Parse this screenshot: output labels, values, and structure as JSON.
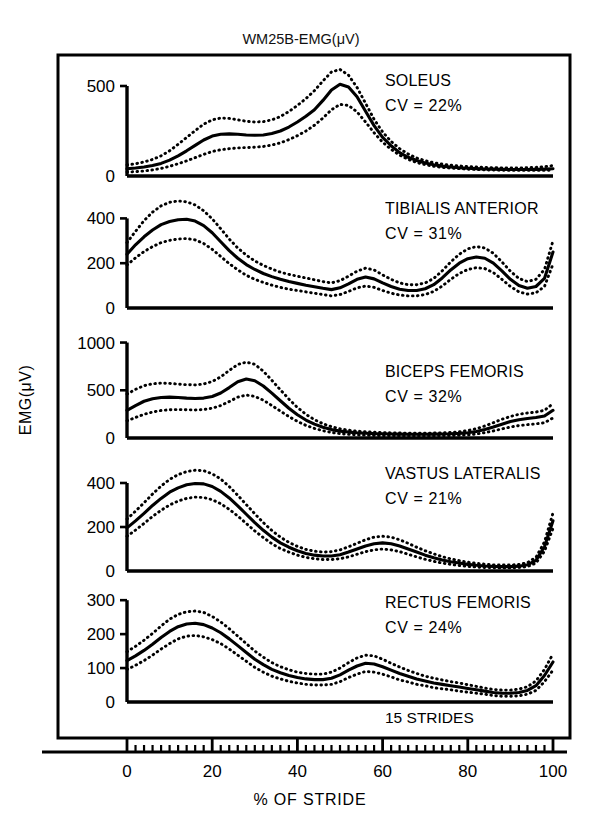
{
  "figure": {
    "title": "WM25B-EMG(μV)",
    "ylabel": "EMG(μV)",
    "xlabel": "% OF STRIDE",
    "strides_note": "15 STRIDES",
    "frame_color": "#000000",
    "curve_color": "#000000",
    "background": "#ffffff"
  },
  "chart_data": {
    "type": "line",
    "title": "WM25B-EMG(μV)",
    "xlabel": "% OF STRIDE",
    "ylabel": "EMG(μV)",
    "grid": false,
    "legend_position": "none",
    "annotations": [
      "15 STRIDES"
    ],
    "xlim": [
      0,
      100
    ],
    "xticks": [
      0,
      20,
      40,
      60,
      80,
      100
    ],
    "xticklabels": [
      "0",
      "20",
      "40",
      "60",
      "80",
      "100"
    ],
    "x_minor_tick_step": 2,
    "x": [
      0,
      2,
      4,
      6,
      8,
      10,
      12,
      14,
      16,
      18,
      20,
      22,
      24,
      26,
      28,
      30,
      32,
      34,
      36,
      38,
      40,
      42,
      44,
      46,
      48,
      50,
      52,
      54,
      56,
      58,
      60,
      62,
      64,
      66,
      68,
      70,
      72,
      74,
      76,
      78,
      80,
      82,
      84,
      86,
      88,
      90,
      92,
      94,
      96,
      98,
      100
    ],
    "panels": [
      {
        "muscle": "SOLEUS",
        "cv_label": "CV = 22%",
        "cv_percent": 22,
        "ylim": [
          0,
          600
        ],
        "yticks": [
          0,
          500
        ],
        "yticklabels": [
          "0",
          "500"
        ],
        "series": [
          {
            "name": "mean",
            "style": "solid",
            "values": [
              40,
              44,
              50,
              58,
              70,
              88,
              112,
              140,
              170,
              200,
              222,
              232,
              234,
              232,
              228,
              226,
              228,
              236,
              250,
              272,
              300,
              332,
              368,
              420,
              478,
              510,
              495,
              440,
              360,
              280,
              215,
              168,
              130,
              104,
              86,
              72,
              62,
              55,
              50,
              46,
              43,
              41,
              39,
              38,
              37,
              36,
              36,
              36,
              37,
              38,
              40
            ]
          },
          {
            "name": "+1SD",
            "style": "dotted",
            "values": [
              62,
              68,
              78,
              92,
              112,
              140,
              176,
              214,
              252,
              288,
              312,
              322,
              320,
              312,
              304,
              300,
              302,
              312,
              330,
              358,
              392,
              430,
              474,
              528,
              578,
              592,
              560,
              492,
              404,
              315,
              245,
              192,
              152,
              122,
              100,
              85,
              74,
              66,
              60,
              56,
              52,
              50,
              48,
              46,
              45,
              45,
              45,
              46,
              48,
              52,
              58
            ]
          },
          {
            "name": "-1SD",
            "style": "dotted",
            "values": [
              22,
              24,
              28,
              34,
              42,
              54,
              68,
              84,
              102,
              120,
              136,
              146,
              152,
              156,
              158,
              160,
              164,
              172,
              184,
              202,
              224,
              250,
              282,
              322,
              368,
              398,
              392,
              356,
              300,
              240,
              188,
              148,
              116,
              92,
              75,
              63,
              54,
              48,
              44,
              41,
              38,
              36,
              34,
              33,
              32,
              31,
              31,
              31,
              31,
              31,
              32
            ]
          }
        ]
      },
      {
        "muscle": "TIBIALIS ANTERIOR",
        "cv_label": "CV = 31%",
        "cv_percent": 31,
        "ylim": [
          0,
          500
        ],
        "yticks": [
          0,
          200,
          400
        ],
        "yticklabels": [
          "0",
          "200",
          "400"
        ],
        "series": [
          {
            "name": "mean",
            "style": "solid",
            "values": [
              240,
              282,
              318,
              348,
              372,
              386,
              394,
              396,
              388,
              368,
              336,
              296,
              256,
              222,
              194,
              172,
              154,
              140,
              128,
              118,
              110,
              102,
              95,
              88,
              82,
              90,
              108,
              128,
              138,
              130,
              112,
              96,
              84,
              78,
              78,
              86,
              104,
              134,
              170,
              200,
              220,
              228,
              222,
              200,
              166,
              128,
              100,
              88,
              96,
              132,
              250
            ]
          },
          {
            "name": "+1SD",
            "style": "dotted",
            "values": [
              292,
              342,
              390,
              428,
              456,
              472,
              478,
              474,
              460,
              434,
              398,
              354,
              308,
              268,
              236,
              210,
              190,
              174,
              160,
              150,
              142,
              134,
              126,
              118,
              112,
              122,
              142,
              164,
              178,
              170,
              148,
              128,
              112,
              104,
              104,
              112,
              132,
              166,
              206,
              240,
              264,
              274,
              268,
              244,
              206,
              164,
              132,
              118,
              128,
              172,
              300
            ]
          },
          {
            "name": "-1SD",
            "style": "dotted",
            "values": [
              192,
              224,
              252,
              274,
              292,
              302,
              308,
              310,
              304,
              288,
              262,
              230,
              198,
              170,
              146,
              128,
              114,
              102,
              92,
              84,
              78,
              72,
              66,
              60,
              54,
              60,
              74,
              90,
              98,
              92,
              78,
              66,
              58,
              54,
              54,
              60,
              74,
              98,
              128,
              154,
              172,
              180,
              176,
              158,
              128,
              96,
              72,
              62,
              68,
              96,
              196
            ]
          }
        ]
      },
      {
        "muscle": "BICEPS FEMORIS",
        "cv_label": "CV = 32%",
        "cv_percent": 32,
        "ylim": [
          0,
          1100
        ],
        "yticks": [
          0,
          500,
          1000
        ],
        "yticklabels": [
          "0",
          "500",
          "1000"
        ],
        "series": [
          {
            "name": "mean",
            "style": "solid",
            "values": [
              290,
              340,
              385,
              412,
              425,
              428,
              424,
              418,
              414,
              418,
              435,
              472,
              528,
              590,
              618,
              600,
              545,
              470,
              390,
              312,
              244,
              188,
              145,
              112,
              88,
              72,
              62,
              55,
              50,
              46,
              44,
              42,
              41,
              40,
              40,
              40,
              41,
              42,
              44,
              48,
              55,
              68,
              88,
              115,
              145,
              172,
              192,
              205,
              215,
              230,
              290
            ]
          },
          {
            "name": "+1SD",
            "style": "dotted",
            "values": [
              460,
              510,
              548,
              568,
              575,
              572,
              565,
              558,
              556,
              566,
              592,
              640,
              708,
              770,
              795,
              772,
              700,
              605,
              505,
              408,
              320,
              248,
              192,
              150,
              118,
              96,
              82,
              72,
              65,
              60,
              56,
              54,
              52,
              51,
              51,
              51,
              52,
              54,
              58,
              65,
              78,
              98,
              126,
              160,
              196,
              226,
              248,
              262,
              272,
              290,
              360
            ]
          },
          {
            "name": "-1SD",
            "style": "dotted",
            "values": [
              180,
              215,
              248,
              272,
              288,
              296,
              298,
              296,
              294,
              298,
              312,
              340,
              382,
              428,
              450,
              436,
              396,
              340,
              282,
              224,
              174,
              132,
              100,
              76,
              58,
              46,
              38,
              33,
              29,
              26,
              24,
              23,
              22,
              21,
              21,
              21,
              22,
              23,
              25,
              28,
              33,
              42,
              56,
              74,
              95,
              115,
              130,
              140,
              148,
              160,
              210
            ]
          }
        ]
      },
      {
        "muscle": "VASTUS LATERALIS",
        "cv_label": "CV = 21%",
        "cv_percent": 21,
        "ylim": [
          0,
          500
        ],
        "yticks": [
          0,
          200,
          400
        ],
        "yticklabels": [
          "0",
          "200",
          "400"
        ],
        "series": [
          {
            "name": "mean",
            "style": "solid",
            "values": [
              196,
              228,
              262,
              298,
              330,
              358,
              378,
              392,
              398,
              396,
              384,
              362,
              332,
              296,
              258,
              220,
              185,
              154,
              128,
              108,
              92,
              80,
              72,
              68,
              68,
              74,
              86,
              100,
              114,
              124,
              128,
              124,
              114,
              100,
              86,
              72,
              60,
              50,
              42,
              36,
              30,
              26,
              23,
              21,
              20,
              20,
              22,
              28,
              48,
              110,
              228
            ]
          },
          {
            "name": "+1SD",
            "style": "dotted",
            "values": [
              236,
              272,
              310,
              350,
              386,
              416,
              438,
              452,
              458,
              456,
              442,
              418,
              384,
              344,
              302,
              260,
              220,
              184,
              154,
              130,
              112,
              98,
              90,
              86,
              88,
              96,
              110,
              126,
              142,
              154,
              158,
              154,
              142,
              126,
              108,
              92,
              78,
              65,
              55,
              47,
              40,
              35,
              31,
              28,
              27,
              27,
              30,
              38,
              62,
              132,
              264
            ]
          },
          {
            "name": "-1SD",
            "style": "dotted",
            "values": [
              158,
              186,
              216,
              248,
              276,
              300,
              318,
              330,
              336,
              334,
              324,
              306,
              280,
              250,
              216,
              182,
              152,
              124,
              102,
              86,
              72,
              62,
              56,
              52,
              52,
              56,
              64,
              76,
              88,
              96,
              100,
              96,
              88,
              76,
              64,
              53,
              44,
              36,
              30,
              25,
              21,
              18,
              16,
              15,
              14,
              14,
              16,
              20,
              36,
              90,
              194
            ]
          }
        ]
      },
      {
        "muscle": "RECTUS FEMORIS",
        "cv_label": "CV = 24%",
        "cv_percent": 24,
        "ylim": [
          0,
          330
        ],
        "yticks": [
          0,
          100,
          200,
          300
        ],
        "yticklabels": [
          "0",
          "100",
          "200",
          "300"
        ],
        "series": [
          {
            "name": "mean",
            "style": "solid",
            "values": [
              122,
              136,
              152,
              170,
              190,
              208,
              222,
              230,
              232,
              228,
              218,
              204,
              186,
              166,
              146,
              126,
              110,
              96,
              86,
              78,
              72,
              68,
              66,
              66,
              70,
              80,
              94,
              106,
              114,
              112,
              104,
              94,
              84,
              76,
              68,
              62,
              56,
              52,
              48,
              44,
              40,
              36,
              32,
              28,
              26,
              26,
              28,
              34,
              48,
              78,
              118
            ]
          },
          {
            "name": "+1SD",
            "style": "dotted",
            "values": [
              148,
              164,
              182,
              202,
              224,
              244,
              258,
              266,
              268,
              264,
              252,
              236,
              216,
              194,
              172,
              150,
              132,
              116,
              104,
              95,
              88,
              84,
              82,
              82,
              88,
              100,
              116,
              130,
              138,
              136,
              126,
              114,
              103,
              93,
              84,
              76,
              70,
              65,
              60,
              56,
              51,
              46,
              41,
              37,
              35,
              35,
              38,
              45,
              62,
              96,
              142
            ]
          },
          {
            "name": "-1SD",
            "style": "dotted",
            "values": [
              96,
              108,
              122,
              138,
              156,
              172,
              186,
              194,
              196,
              192,
              184,
              172,
              156,
              138,
              120,
              102,
              88,
              76,
              68,
              61,
              56,
              52,
              50,
              50,
              52,
              60,
              72,
              82,
              90,
              88,
              82,
              74,
              65,
              59,
              52,
              48,
              42,
              39,
              36,
              32,
              29,
              26,
              23,
              19,
              17,
              17,
              18,
              23,
              34,
              60,
              94
            ]
          }
        ]
      }
    ]
  }
}
